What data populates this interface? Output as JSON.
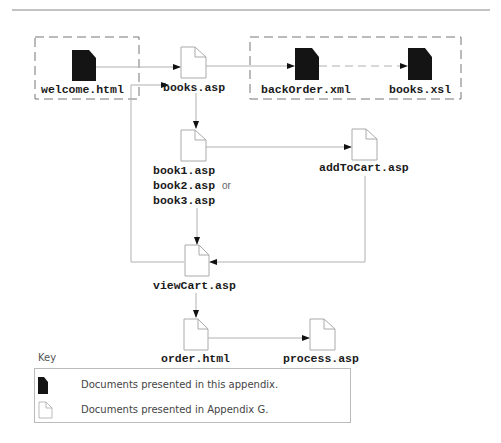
{
  "colors": {
    "line": "#b0b0b0",
    "dark_doc": "#141414",
    "light_doc_stroke": "#aaaaaa",
    "dashed_box": "#777777",
    "text": "#1a1a1a"
  },
  "nodes": {
    "welcome": {
      "label": "welcome.html",
      "type": "dark-document"
    },
    "books_asp": {
      "label": "books.asp",
      "type": "light-document"
    },
    "backorder": {
      "label": "backOrder.xml",
      "type": "dark-document"
    },
    "books_xsl": {
      "label": "books.xsl",
      "type": "dark-document"
    },
    "book_pages": {
      "line1": "book1.asp",
      "line2": "book2.asp",
      "or": "or",
      "line3": "book3.asp",
      "type": "light-document"
    },
    "addtocart": {
      "label": "addToCart.asp",
      "type": "light-document"
    },
    "viewcart": {
      "label": "viewCart.asp",
      "type": "light-document"
    },
    "order": {
      "label": "order.html",
      "type": "light-document"
    },
    "process": {
      "label": "process.asp",
      "type": "light-document"
    }
  },
  "edges": [
    {
      "from": "welcome.html",
      "to": "books.asp",
      "style": "solid"
    },
    {
      "from": "books.asp",
      "to": "backOrder.xml",
      "style": "solid"
    },
    {
      "from": "backOrder.xml",
      "to": "books.xsl",
      "style": "dashed"
    },
    {
      "from": "books.asp",
      "to": "book1.asp / book2.asp / book3.asp",
      "style": "solid"
    },
    {
      "from": "book1.asp / book2.asp / book3.asp",
      "to": "addToCart.asp",
      "style": "solid"
    },
    {
      "from": "book1.asp / book2.asp / book3.asp",
      "to": "viewCart.asp",
      "style": "solid"
    },
    {
      "from": "addToCart.asp",
      "to": "viewCart.asp",
      "style": "solid"
    },
    {
      "from": "viewCart.asp",
      "to": "books.asp",
      "style": "solid"
    },
    {
      "from": "viewCart.asp",
      "to": "order.html",
      "style": "solid"
    },
    {
      "from": "order.html",
      "to": "process.asp",
      "style": "solid"
    }
  ],
  "key": {
    "title": "Key",
    "items": [
      {
        "icon": "dark-document-icon",
        "text": "Documents presented in this appendix."
      },
      {
        "icon": "light-document-icon",
        "text": "Documents presented in Appendix G."
      }
    ]
  }
}
